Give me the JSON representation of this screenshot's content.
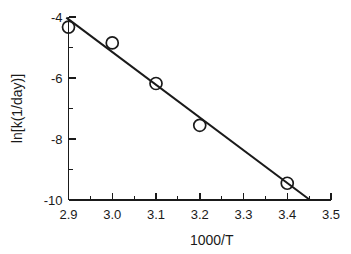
{
  "chart_data": {
    "type": "scatter",
    "title": "",
    "subtitle": "",
    "xlabel": "1000/T",
    "ylabel": "ln[k(1/day)]",
    "xlim": [
      2.9,
      3.5
    ],
    "ylim": [
      -10,
      -4
    ],
    "grid": false,
    "legend": false,
    "legend_position": "none",
    "x_ticks": [
      "2.9",
      "3.0",
      "3.1",
      "3.2",
      "3.3",
      "3.4",
      "3.5"
    ],
    "x_tick_values": [
      2.9,
      3.0,
      3.1,
      3.2,
      3.3,
      3.4,
      3.5
    ],
    "x_minor_tick_values": [
      2.95,
      3.05,
      3.15,
      3.25,
      3.35,
      3.45
    ],
    "y_ticks": [
      "-4",
      "-6",
      "-8",
      "-10"
    ],
    "y_tick_values": [
      -4,
      -6,
      -8,
      -10
    ],
    "y_minor_tick_values": [
      -5,
      -7,
      -9
    ],
    "marker_style": "open-circle",
    "marker_radius": 6,
    "series": [
      {
        "name": "data",
        "x": [
          2.9,
          3.0,
          3.1,
          3.2,
          3.4
        ],
        "y": [
          -4.33,
          -4.85,
          -6.18,
          -7.55,
          -9.45
        ]
      }
    ],
    "fit_line": {
      "name": "linear fit",
      "x": [
        2.895,
        3.452
      ],
      "y": [
        -4.02,
        -10.0
      ]
    },
    "colors": {
      "axis": "#1a1a1a",
      "marker": "#1a1a1a",
      "fit_line": "#1a1a1a",
      "background": "#ffffff"
    }
  }
}
